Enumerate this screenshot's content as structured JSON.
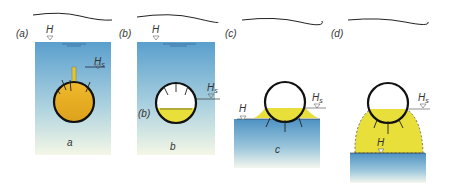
{
  "panels": [
    {
      "id": "a",
      "tag": "(a)",
      "caption": "a",
      "H": "H",
      "Hs": "Hs",
      "state": "pipe fully filled, above groundwater, vent"
    },
    {
      "id": "b",
      "tag": "(b)",
      "caption": "b",
      "side_tag": "(b)",
      "H": "H",
      "Hs": "Hs",
      "state": "pipe partially filled, submerged"
    },
    {
      "id": "c",
      "tag": "(c)",
      "caption": "c",
      "H": "H",
      "Hs": "Hs",
      "state": "pipe at groundwater surface, exfiltration"
    },
    {
      "id": "d",
      "tag": "(d)",
      "caption": "",
      "H": "H",
      "Hs": "Hs",
      "state": "pipe above groundwater, exfiltration mound"
    }
  ],
  "labels": {
    "H": "H",
    "Hs_main": "H",
    "Hs_sub": "s"
  },
  "colors": {
    "water_top": "#5fa3cf",
    "water_bottom": "#f3f6e4",
    "fill_orange": "#e6b020",
    "fill_yellow": "#e8df3a",
    "pipe": "#111111"
  }
}
